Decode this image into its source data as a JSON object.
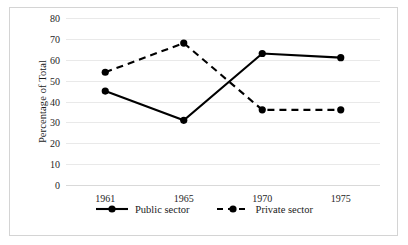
{
  "chart_data": {
    "type": "line",
    "title": "",
    "xlabel": "",
    "ylabel": "Percentage of Total",
    "categories": [
      "1961",
      "1965",
      "1970",
      "1975"
    ],
    "series": [
      {
        "name": "Public sector",
        "values": [
          45,
          31,
          63,
          61
        ],
        "line_style": "solid",
        "color": "#000000",
        "marker": "circle"
      },
      {
        "name": "Private sector",
        "values": [
          54,
          68,
          36,
          36
        ],
        "line_style": "dashed",
        "color": "#000000",
        "marker": "circle"
      }
    ],
    "ylim": [
      0,
      80
    ],
    "yticks": [
      "0",
      "10",
      "20",
      "30",
      "40",
      "50",
      "60",
      "70",
      "80"
    ],
    "grid": true,
    "grid_axis": "y",
    "grid_color": "#e9e9e9",
    "legend_position": "bottom-center",
    "border_color": "#d4d4d4",
    "background": "#ffffff"
  },
  "legend": {
    "entries": [
      {
        "label": "Public sector"
      },
      {
        "label": "Private sector"
      }
    ]
  }
}
